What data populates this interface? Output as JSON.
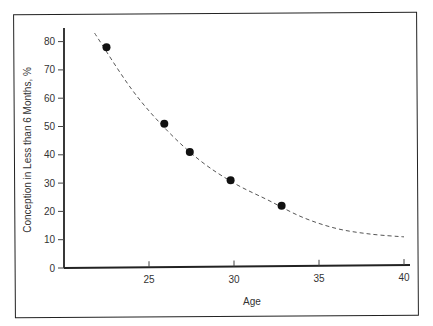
{
  "chart_data": {
    "type": "scatter",
    "title": "",
    "xlabel": "Age",
    "ylabel": "Conception in Less than 6 Months, %",
    "xlim": [
      20,
      40
    ],
    "ylim": [
      0,
      85
    ],
    "x_ticks": [
      25,
      30,
      35,
      40
    ],
    "y_ticks": [
      0,
      10,
      20,
      30,
      40,
      50,
      60,
      70,
      80
    ],
    "grid": false,
    "legend": null,
    "series": [
      {
        "name": "Observed",
        "type": "scatter",
        "x": [
          22.5,
          25.9,
          27.4,
          29.8,
          32.8
        ],
        "y": [
          78,
          51,
          41,
          31,
          22
        ]
      },
      {
        "name": "Fitted trend",
        "type": "line",
        "style": "dashed",
        "x": [
          21.8,
          24,
          26,
          28,
          30,
          32,
          34,
          36,
          38,
          40
        ],
        "y": [
          83,
          63,
          49,
          38,
          30,
          24,
          18,
          14,
          12,
          11
        ]
      }
    ]
  },
  "axes": {
    "xlabel": "Age",
    "ylabel": "Conception in Less than 6 Months, %",
    "x_ticks": [
      "25",
      "30",
      "35",
      "40"
    ],
    "y_ticks": [
      "0",
      "10",
      "20",
      "30",
      "40",
      "50",
      "60",
      "70",
      "80"
    ]
  }
}
